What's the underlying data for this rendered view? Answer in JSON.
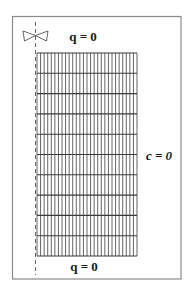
{
  "diagram": {
    "type": "boundary-condition mesh schematic",
    "labels": {
      "top": "q = 0",
      "bottom": "q = 0",
      "right": "c = 0"
    },
    "symbols": {
      "symmetry_axis": "dashed-vertical-line",
      "valve_icon": "bow-tie-valve-icon"
    },
    "mesh": {
      "columns": 28,
      "rows": 10
    },
    "colors": {
      "line": "#555555",
      "border": "#8a8a8a",
      "text": "#1a1a1a",
      "background": "#ffffff"
    }
  }
}
